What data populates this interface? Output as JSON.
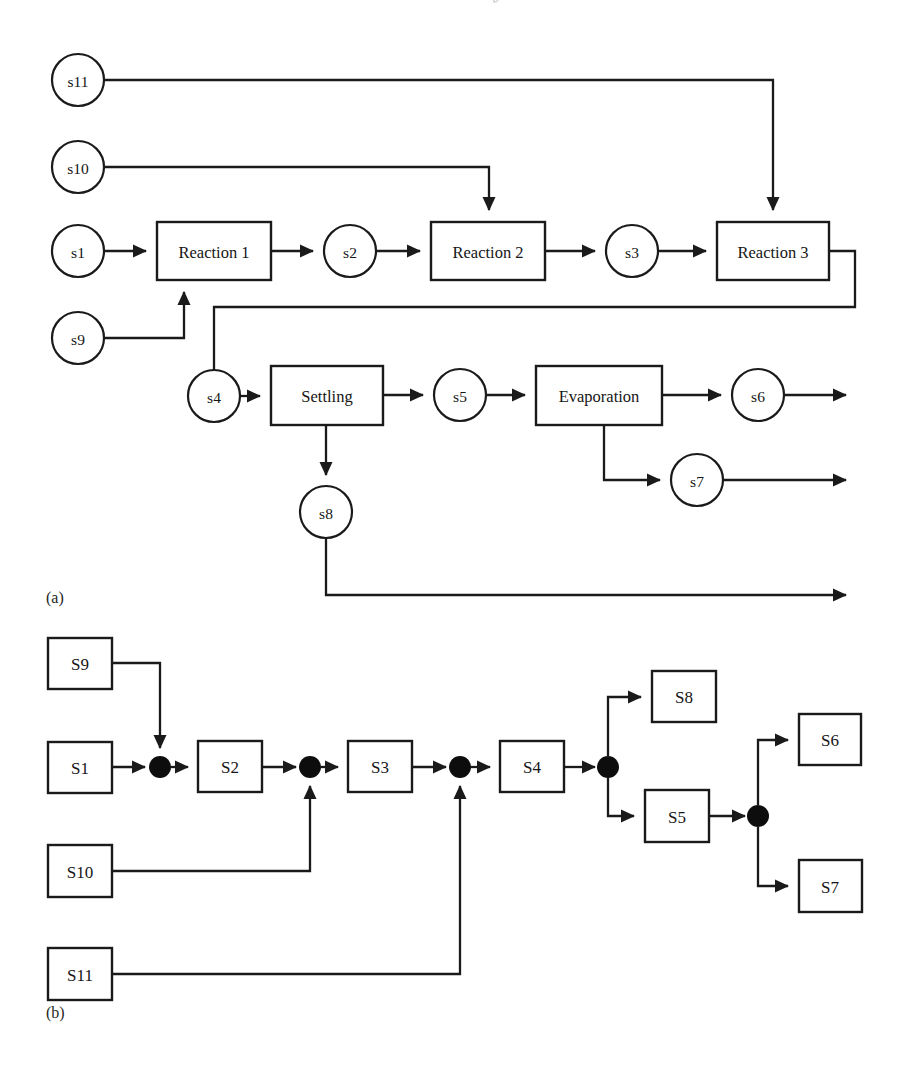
{
  "figure": {
    "panel_a_label": "(a)",
    "panel_b_label": "(b)",
    "top_clipped_text": "g",
    "bottom_caption": ""
  },
  "colors": {
    "stroke": "#1a1a1a",
    "fill": "#ffffff",
    "junction": "#0d0d0d",
    "text": "#161616",
    "background": "#ffffff"
  },
  "panel_a": {
    "title": "Process flowsheet with streams and unit operations",
    "streams": [
      {
        "id": "s11",
        "label": "s11",
        "cx": 78,
        "cy": 80,
        "r": 26
      },
      {
        "id": "s10",
        "label": "s10",
        "cx": 78,
        "cy": 167,
        "r": 26
      },
      {
        "id": "s1",
        "label": "s1",
        "cx": 78,
        "cy": 251,
        "r": 26
      },
      {
        "id": "s9",
        "label": "s9",
        "cx": 78,
        "cy": 338,
        "r": 26
      },
      {
        "id": "s2",
        "label": "s2",
        "cx": 350,
        "cy": 251,
        "r": 26
      },
      {
        "id": "s3",
        "label": "s3",
        "cx": 632,
        "cy": 251,
        "r": 26
      },
      {
        "id": "s4",
        "label": "s4",
        "cx": 214,
        "cy": 396,
        "r": 26
      },
      {
        "id": "s5",
        "label": "s5",
        "cx": 460,
        "cy": 395,
        "r": 26
      },
      {
        "id": "s6",
        "label": "s6",
        "cx": 758,
        "cy": 395,
        "r": 26
      },
      {
        "id": "s7",
        "label": "s7",
        "cx": 697,
        "cy": 480,
        "r": 26
      },
      {
        "id": "s8",
        "label": "s8",
        "cx": 326,
        "cy": 512,
        "r": 26
      }
    ],
    "units": [
      {
        "id": "reaction1",
        "label": "Reaction 1",
        "x": 157,
        "y": 222,
        "w": 114,
        "h": 58
      },
      {
        "id": "reaction2",
        "label": "Reaction 2",
        "x": 431,
        "y": 222,
        "w": 114,
        "h": 58
      },
      {
        "id": "reaction3",
        "label": "Reaction 3",
        "x": 717,
        "y": 222,
        "w": 112,
        "h": 58
      },
      {
        "id": "settling",
        "label": "Settling",
        "x": 271,
        "y": 366,
        "w": 112,
        "h": 59
      },
      {
        "id": "evaporation",
        "label": "Evaporation",
        "x": 536,
        "y": 366,
        "w": 126,
        "h": 59
      }
    ],
    "connections": [
      {
        "from": "s11",
        "to": "reaction3",
        "kind": "feed"
      },
      {
        "from": "s10",
        "to": "reaction2",
        "kind": "feed"
      },
      {
        "from": "s1",
        "to": "reaction1",
        "kind": "feed"
      },
      {
        "from": "s9",
        "to": "reaction1",
        "kind": "feed"
      },
      {
        "from": "reaction1",
        "to": "s2",
        "kind": "product"
      },
      {
        "from": "s2",
        "to": "reaction2",
        "kind": "feed"
      },
      {
        "from": "reaction2",
        "to": "s3",
        "kind": "product"
      },
      {
        "from": "s3",
        "to": "reaction3",
        "kind": "feed"
      },
      {
        "from": "reaction3",
        "to": "s4",
        "kind": "product"
      },
      {
        "from": "s4",
        "to": "settling",
        "kind": "feed"
      },
      {
        "from": "settling",
        "to": "s5",
        "kind": "product"
      },
      {
        "from": "settling",
        "to": "s8",
        "kind": "product"
      },
      {
        "from": "s5",
        "to": "evaporation",
        "kind": "feed"
      },
      {
        "from": "evaporation",
        "to": "s6",
        "kind": "product"
      },
      {
        "from": "evaporation",
        "to": "s7",
        "kind": "product"
      },
      {
        "from": "s6",
        "to": "outlet",
        "kind": "outlet"
      },
      {
        "from": "s7",
        "to": "outlet",
        "kind": "outlet"
      },
      {
        "from": "s8",
        "to": "outlet",
        "kind": "outlet"
      }
    ]
  },
  "panel_b": {
    "title": "Equivalent stream-node graph representation",
    "nodes": [
      {
        "id": "S9",
        "label": "S9",
        "x": 48,
        "y": 638,
        "w": 64,
        "h": 51
      },
      {
        "id": "S1",
        "label": "S1",
        "x": 48,
        "y": 742,
        "w": 64,
        "h": 51
      },
      {
        "id": "S2",
        "label": "S2",
        "x": 198,
        "y": 741,
        "w": 64,
        "h": 51
      },
      {
        "id": "S3",
        "label": "S3",
        "x": 348,
        "y": 741,
        "w": 64,
        "h": 51
      },
      {
        "id": "S4",
        "label": "S4",
        "x": 500,
        "y": 741,
        "w": 64,
        "h": 51
      },
      {
        "id": "S8",
        "label": "S8",
        "x": 652,
        "y": 671,
        "w": 64,
        "h": 51
      },
      {
        "id": "S5",
        "label": "S5",
        "x": 645,
        "y": 790,
        "w": 64,
        "h": 52
      },
      {
        "id": "S6",
        "label": "S6",
        "x": 799,
        "y": 714,
        "w": 62,
        "h": 51
      },
      {
        "id": "S7",
        "label": "S7",
        "x": 799,
        "y": 860,
        "w": 63,
        "h": 52
      },
      {
        "id": "S10",
        "label": "S10",
        "x": 48,
        "y": 845,
        "w": 64,
        "h": 52
      },
      {
        "id": "S11",
        "label": "S11",
        "x": 48,
        "y": 948,
        "w": 64,
        "h": 52
      }
    ],
    "junctions": [
      {
        "id": "j1",
        "cx": 160,
        "cy": 767,
        "r": 11
      },
      {
        "id": "j2",
        "cx": 310,
        "cy": 767,
        "r": 11
      },
      {
        "id": "j3",
        "cx": 460,
        "cy": 767,
        "r": 11
      },
      {
        "id": "j4",
        "cx": 608,
        "cy": 767,
        "r": 11
      },
      {
        "id": "j5",
        "cx": 758,
        "cy": 816,
        "r": 11
      }
    ],
    "connections": [
      {
        "from": "S1",
        "to": "j1"
      },
      {
        "from": "S9",
        "to": "j1"
      },
      {
        "from": "j1",
        "to": "S2"
      },
      {
        "from": "S2",
        "to": "j2"
      },
      {
        "from": "S10",
        "to": "j2"
      },
      {
        "from": "j2",
        "to": "S3"
      },
      {
        "from": "S3",
        "to": "j3"
      },
      {
        "from": "S11",
        "to": "j3"
      },
      {
        "from": "j3",
        "to": "S4"
      },
      {
        "from": "S4",
        "to": "j4"
      },
      {
        "from": "j4",
        "to": "S8"
      },
      {
        "from": "j4",
        "to": "S5"
      },
      {
        "from": "S5",
        "to": "j5"
      },
      {
        "from": "j5",
        "to": "S6"
      },
      {
        "from": "j5",
        "to": "S7"
      }
    ]
  }
}
